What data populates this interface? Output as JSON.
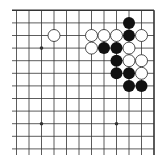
{
  "board": {
    "description": "Go board fragment (top-right corner), 12 columns x 12 rows visible",
    "cols": 12,
    "rows": 12,
    "edges": {
      "top": true,
      "right": true,
      "left": false,
      "bottom": false
    },
    "colors": {
      "line": "#333333",
      "black_stone": "#111111",
      "white_stone": "#ffffff",
      "background": "#ffffff"
    },
    "star_points": [
      {
        "col": 2,
        "row": 3
      },
      {
        "col": 2,
        "row": 9
      },
      {
        "col": 8,
        "row": 9
      }
    ],
    "stones": [
      {
        "color": "black",
        "col": 9,
        "row": 1
      },
      {
        "color": "white",
        "col": 3,
        "row": 2
      },
      {
        "color": "white",
        "col": 6,
        "row": 2
      },
      {
        "color": "white",
        "col": 7,
        "row": 2
      },
      {
        "color": "white",
        "col": 8,
        "row": 2
      },
      {
        "color": "black",
        "col": 9,
        "row": 2
      },
      {
        "color": "white",
        "col": 10,
        "row": 2
      },
      {
        "color": "white",
        "col": 6,
        "row": 3
      },
      {
        "color": "black",
        "col": 7,
        "row": 3
      },
      {
        "color": "black",
        "col": 8,
        "row": 3
      },
      {
        "color": "white",
        "col": 9,
        "row": 3
      },
      {
        "color": "black",
        "col": 8,
        "row": 4
      },
      {
        "color": "white",
        "col": 9,
        "row": 4
      },
      {
        "color": "white",
        "col": 10,
        "row": 4
      },
      {
        "color": "black",
        "col": 8,
        "row": 5
      },
      {
        "color": "black",
        "col": 9,
        "row": 5
      },
      {
        "color": "white",
        "col": 10,
        "row": 5
      },
      {
        "color": "black",
        "col": 9,
        "row": 6
      },
      {
        "color": "black",
        "col": 10,
        "row": 6
      }
    ]
  }
}
